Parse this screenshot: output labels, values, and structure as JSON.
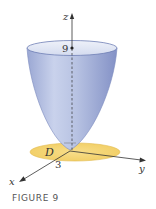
{
  "figure": {
    "caption": "FIGURE 9",
    "labels": {
      "z_axis": "z",
      "x_axis": "x",
      "y_axis": "y",
      "height_value": "9",
      "radius_value": "3",
      "region": "D"
    },
    "colors": {
      "surface_light": "#dfe5f2",
      "surface_mid": "#b4c0e0",
      "surface_dark": "#8d9ccc",
      "rim_stroke": "#6f7fb5",
      "disk_fill": "#f5d77a",
      "disk_stroke": "#e1b949",
      "axis": "#333333"
    }
  }
}
